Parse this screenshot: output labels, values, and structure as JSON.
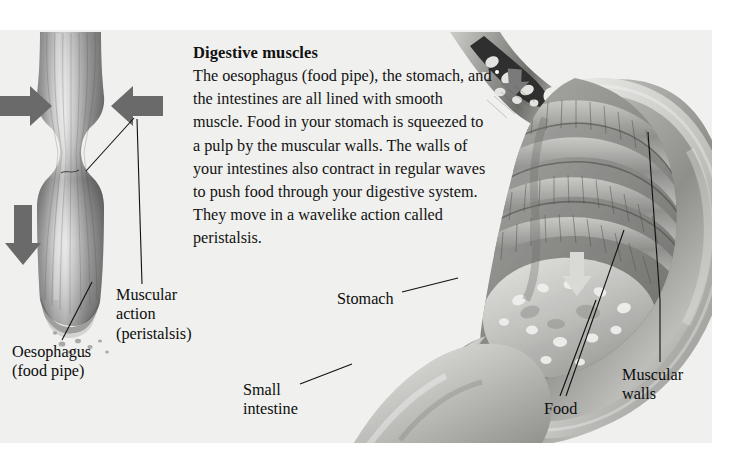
{
  "figure": {
    "kind": "anatomy-illustration",
    "background_color": "#f0f0ee",
    "page_color": "#ffffff",
    "ink_color": "#0d0d0d"
  },
  "article": {
    "heading": "Digestive muscles",
    "body": "The oesophagus (food pipe), the stomach, and the intestines are all lined with smooth muscle. Food in your stomach is squeezed to a pulp by the muscular walls. The walls of your intestines also contract in regular waves to push food through your digestive system. They move in a wavelike action called peristalsis."
  },
  "labels": {
    "muscular_action": "Muscular\naction\n(peristalsis)",
    "oesophagus": "Oesophagus\n(food pipe)",
    "stomach": "Stomach",
    "small_intestine": "Small\nintestine",
    "food": "Food",
    "muscular_walls": "Muscular\nwalls"
  },
  "diagram_parts": {
    "oesophagus_tube": "oesophagus-tube-illustration",
    "constriction_arrow_left": "arrow-right-icon",
    "constriction_arrow_right": "arrow-left-icon",
    "flow_arrow_down": "arrow-down-icon",
    "stomach_cutaway": "stomach-cutaway-illustration",
    "food_bolus_arrow": "arrow-down-icon",
    "stomach_food_arrow": "arrow-down-icon"
  }
}
